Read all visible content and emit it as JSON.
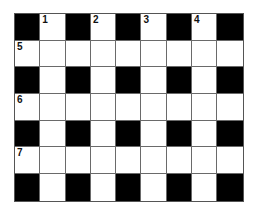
{
  "puzzle": {
    "rows": 7,
    "cols": 9,
    "colors": {
      "block": "#000000",
      "empty": "#ffffff",
      "line": "#6a6a6a"
    },
    "grid": [
      [
        "#",
        "1",
        "#",
        "2",
        "#",
        "3",
        "#",
        "4",
        "#"
      ],
      [
        "5",
        ".",
        ".",
        ".",
        ".",
        ".",
        ".",
        ".",
        "."
      ],
      [
        "#",
        ".",
        "#",
        ".",
        "#",
        ".",
        "#",
        ".",
        "#"
      ],
      [
        "6",
        ".",
        ".",
        ".",
        ".",
        ".",
        ".",
        ".",
        "."
      ],
      [
        "#",
        ".",
        "#",
        ".",
        "#",
        ".",
        "#",
        ".",
        "#"
      ],
      [
        "7",
        ".",
        ".",
        ".",
        ".",
        ".",
        ".",
        ".",
        "."
      ],
      [
        "#",
        ".",
        "#",
        ".",
        "#",
        ".",
        "#",
        ".",
        "#"
      ]
    ]
  }
}
